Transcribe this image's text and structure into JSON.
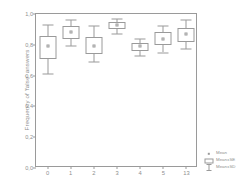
{
  "chart_data": {
    "type": "box",
    "title": "",
    "xlabel": "",
    "ylabel": "Frequency of 'false' answers",
    "ylim": [
      0.0,
      1.0
    ],
    "yticks": [
      0.0,
      0.2,
      0.4,
      0.6,
      0.8,
      1.0
    ],
    "ytick_labels": [
      "0,0",
      "0,2",
      "0,4",
      "0,6",
      "0,8",
      "1,0"
    ],
    "grid": false,
    "legend_position": "bottom-right",
    "categories": [
      "0",
      "1",
      "2",
      "3",
      "4",
      "5",
      "13"
    ],
    "series": [
      {
        "name": "Mean",
        "values": [
          0.79,
          0.88,
          0.79,
          0.93,
          0.79,
          0.84,
          0.87
        ]
      },
      {
        "name": "Mean±SE",
        "lower": [
          0.71,
          0.84,
          0.74,
          0.9,
          0.76,
          0.8,
          0.82
        ],
        "upper": [
          0.86,
          0.92,
          0.85,
          0.95,
          0.81,
          0.88,
          0.91
        ]
      },
      {
        "name": "Mean±SD",
        "lower": [
          0.61,
          0.79,
          0.69,
          0.87,
          0.73,
          0.75,
          0.77
        ],
        "upper": [
          0.93,
          0.96,
          0.92,
          0.97,
          0.84,
          0.92,
          0.96
        ]
      }
    ],
    "boxes": [
      {
        "category": "0",
        "mean": 0.79,
        "se_low": 0.71,
        "se_high": 0.86,
        "sd_low": 0.61,
        "sd_high": 0.93
      },
      {
        "category": "1",
        "mean": 0.88,
        "se_low": 0.84,
        "se_high": 0.92,
        "sd_low": 0.79,
        "sd_high": 0.96
      },
      {
        "category": "2",
        "mean": 0.79,
        "se_low": 0.74,
        "se_high": 0.85,
        "sd_low": 0.69,
        "sd_high": 0.92
      },
      {
        "category": "3",
        "mean": 0.93,
        "se_low": 0.9,
        "se_high": 0.95,
        "sd_low": 0.87,
        "sd_high": 0.97
      },
      {
        "category": "4",
        "mean": 0.79,
        "se_low": 0.76,
        "se_high": 0.81,
        "sd_low": 0.73,
        "sd_high": 0.84
      },
      {
        "category": "5",
        "mean": 0.84,
        "se_low": 0.8,
        "se_high": 0.88,
        "sd_low": 0.75,
        "sd_high": 0.92
      },
      {
        "category": "13",
        "mean": 0.87,
        "se_low": 0.82,
        "se_high": 0.91,
        "sd_low": 0.77,
        "sd_high": 0.96
      }
    ]
  },
  "legend": {
    "entries": [
      {
        "label": "Mean",
        "symbol": "mean-marker-icon"
      },
      {
        "label": "Mean±SE",
        "symbol": "se-box-icon"
      },
      {
        "label": "Mean±SD",
        "symbol": "sd-whisker-icon"
      }
    ]
  },
  "colors": {
    "line": "#9a9a9a",
    "text": "#8f8f8f",
    "background": "#ffffff"
  }
}
